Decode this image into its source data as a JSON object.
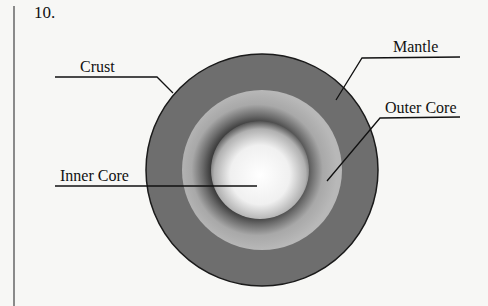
{
  "question": {
    "number": "10."
  },
  "diagram": {
    "labels": [
      {
        "id": "crust",
        "text": "Crust"
      },
      {
        "id": "mantle",
        "text": "Mantle"
      },
      {
        "id": "outer_core",
        "text": "Outer Core"
      },
      {
        "id": "inner_core",
        "text": "Inner Core"
      }
    ],
    "colors": {
      "background": "#f7f7f5",
      "mantle": "#6e6e6e",
      "outer_core": "#b4b4b4",
      "inner_core_center": "#ffffff",
      "outline": "#1a1a1a"
    }
  }
}
